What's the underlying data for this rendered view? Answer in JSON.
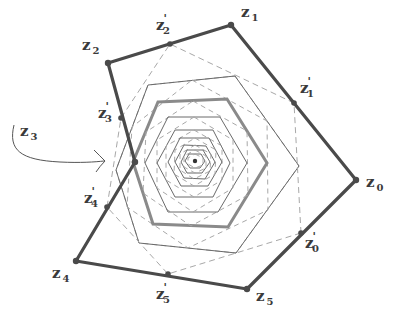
{
  "diagram": {
    "colors": {
      "outer": "#4a4a4a",
      "thick_gray": "#8a8a8a",
      "thin_dark": "#6a6a6a",
      "dashed": "#a8a8a8",
      "label": "#3a3a3a",
      "background": "#ffffff"
    },
    "center": {
      "x": 195,
      "y": 161
    },
    "outer_polygon": {
      "name": "z",
      "vertices": [
        {
          "label": "z",
          "sub": "0",
          "x": 356,
          "y": 180,
          "lx": 366,
          "ly": 187
        },
        {
          "label": "z",
          "sub": "1",
          "x": 231,
          "y": 25,
          "lx": 241,
          "ly": 17
        },
        {
          "label": "z",
          "sub": "2",
          "x": 108,
          "y": 63,
          "lx": 82,
          "ly": 50
        },
        {
          "label": "z",
          "sub": "3",
          "x": 135,
          "y": 162,
          "lx": 18,
          "ly": 132
        },
        {
          "label": "z",
          "sub": "4",
          "x": 76,
          "y": 261,
          "lx": 52,
          "ly": 278
        },
        {
          "label": "z",
          "sub": "5",
          "x": 247,
          "y": 289,
          "lx": 256,
          "ly": 301
        }
      ]
    },
    "midpoint_polygon": {
      "name": "z'",
      "vertices": [
        {
          "label": "z",
          "sub": "0",
          "x": 301,
          "y": 233,
          "lx": 305,
          "ly": 248
        },
        {
          "label": "z",
          "sub": "1",
          "x": 294,
          "y": 103,
          "lx": 300,
          "ly": 93
        },
        {
          "label": "z",
          "sub": "2",
          "x": 170,
          "y": 44,
          "lx": 156,
          "ly": 30
        },
        {
          "label": "z",
          "sub": "3",
          "x": 121,
          "y": 118,
          "lx": 98,
          "ly": 118
        },
        {
          "label": "z",
          "sub": "4",
          "x": 107,
          "y": 207,
          "lx": 84,
          "ly": 203
        },
        {
          "label": "z",
          "sub": "5",
          "x": 168,
          "y": 274,
          "lx": 156,
          "ly": 299
        }
      ]
    },
    "arrow_label": {
      "label": "z",
      "sub": "3",
      "x": 20,
      "y": 136
    },
    "inner_hexagons": [
      {
        "style": "dashed",
        "points": [
          [
            235,
            76
          ],
          [
            299,
            166
          ],
          [
            236,
            253
          ],
          [
            139,
            243
          ],
          [
            116,
            170
          ],
          [
            148,
            85
          ]
        ],
        "scale": 1.0
      },
      {
        "style": "thin",
        "points": [
          [
            148,
            85
          ],
          [
            235,
            76
          ],
          [
            299,
            166
          ],
          [
            236,
            253
          ],
          [
            139,
            243
          ],
          [
            116,
            170
          ]
        ]
      },
      {
        "style": "dashed",
        "points": [
          [
            192,
            80
          ],
          [
            267,
            121
          ],
          [
            268,
            210
          ],
          [
            188,
            248
          ],
          [
            127,
            207
          ],
          [
            132,
            127
          ]
        ]
      },
      {
        "style": "thick",
        "points": [
          [
            158,
            102
          ],
          [
            227,
            99
          ],
          [
            267,
            163
          ],
          [
            228,
            227
          ],
          [
            153,
            224
          ],
          [
            133,
            162
          ]
        ]
      },
      {
        "style": "dashed",
        "points": [
          [
            193,
            101
          ],
          [
            247,
            131
          ],
          [
            248,
            195
          ],
          [
            191,
            226
          ],
          [
            143,
            193
          ],
          [
            146,
            132
          ]
        ]
      },
      {
        "style": "thin",
        "points": [
          [
            168,
            117
          ],
          [
            220,
            117
          ],
          [
            247,
            163
          ],
          [
            218,
            212
          ],
          [
            168,
            212
          ],
          [
            145,
            163
          ]
        ]
      },
      {
        "style": "dashed",
        "points": [
          [
            194,
            117
          ],
          [
            233,
            140
          ],
          [
            233,
            188
          ],
          [
            193,
            212
          ],
          [
            157,
            188
          ],
          [
            157,
            140
          ]
        ]
      },
      {
        "style": "thin",
        "points": [
          [
            175,
            130
          ],
          [
            213,
            130
          ],
          [
            230,
            163
          ],
          [
            213,
            197
          ],
          [
            175,
            197
          ],
          [
            157,
            163
          ]
        ]
      },
      {
        "style": "dashed",
        "points": [
          [
            194,
            130
          ],
          [
            222,
            146
          ],
          [
            222,
            180
          ],
          [
            194,
            197
          ],
          [
            166,
            180
          ],
          [
            166,
            146
          ]
        ]
      },
      {
        "style": "thin",
        "points": [
          [
            180,
            138
          ],
          [
            209,
            138
          ],
          [
            222,
            162
          ],
          [
            208,
            186
          ],
          [
            181,
            186
          ],
          [
            168,
            162
          ]
        ]
      },
      {
        "style": "dashed",
        "points": [
          [
            195,
            138
          ],
          [
            216,
            150
          ],
          [
            215,
            174
          ],
          [
            194,
            186
          ],
          [
            174,
            174
          ],
          [
            175,
            150
          ]
        ]
      },
      {
        "style": "thin",
        "points": [
          [
            184,
            145
          ],
          [
            206,
            146
          ],
          [
            215,
            162
          ],
          [
            205,
            179
          ],
          [
            184,
            178
          ],
          [
            175,
            162
          ]
        ]
      },
      {
        "style": "dashed",
        "points": [
          [
            195,
            145
          ],
          [
            211,
            154
          ],
          [
            210,
            171
          ],
          [
            194,
            179
          ],
          [
            180,
            170
          ],
          [
            180,
            154
          ]
        ]
      },
      {
        "style": "thin",
        "points": [
          [
            187,
            150
          ],
          [
            203,
            150
          ],
          [
            210,
            162
          ],
          [
            202,
            173
          ],
          [
            187,
            173
          ],
          [
            181,
            162
          ]
        ]
      },
      {
        "style": "dashed",
        "points": [
          [
            195,
            150
          ],
          [
            206,
            156
          ],
          [
            206,
            168
          ],
          [
            195,
            173
          ],
          [
            184,
            167
          ],
          [
            184,
            156
          ]
        ]
      },
      {
        "style": "thin",
        "points": [
          [
            189,
            154
          ],
          [
            201,
            154
          ],
          [
            205,
            161
          ],
          [
            200,
            168
          ],
          [
            190,
            168
          ],
          [
            185,
            161
          ]
        ]
      },
      {
        "style": "dashed",
        "points": [
          [
            195,
            154
          ],
          [
            203,
            158
          ],
          [
            203,
            165
          ],
          [
            195,
            168
          ],
          [
            188,
            164
          ],
          [
            188,
            158
          ]
        ]
      }
    ]
  }
}
